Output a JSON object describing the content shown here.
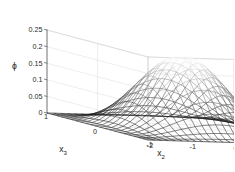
{
  "figure": {
    "background_color": "#ffffff",
    "box_color": "#d8d8d8",
    "grid_color": "#e2e2e2",
    "axis_color": "#6b6b6b",
    "text_color": "#2b2b2b"
  },
  "chart_data": {
    "type": "line",
    "render_style": "surface-mesh-3d",
    "title": "",
    "subtitle": "",
    "zlabel": "ϕ",
    "xlabel": "x_2",
    "ylabel": "x_3",
    "zlabel_display": "ϕ",
    "xlabel_base": "x",
    "xlabel_sub": "2",
    "ylabel_base": "x",
    "ylabel_sub": "3",
    "grid": true,
    "legend": "none",
    "colormap": "grayscale-bone",
    "zlim": [
      0,
      0.25
    ],
    "xlim": [
      -2,
      2
    ],
    "ylim": [
      -1,
      1
    ],
    "zticks": [
      0,
      0.05,
      0.1,
      0.15,
      0.2,
      0.25
    ],
    "ztick_labels": [
      "0",
      "0.05",
      "0.1",
      "0.15",
      "0.2",
      "0.25"
    ],
    "xticks": [
      -2,
      -1,
      0,
      1,
      2
    ],
    "xtick_labels": [
      "-2",
      "-1",
      "0",
      "1",
      "2"
    ],
    "yticks": [
      -1,
      0,
      1
    ],
    "ytick_labels": [
      "-1",
      "0",
      "1"
    ],
    "peak_value": 0.22,
    "peak_at": {
      "x2": 0,
      "x3": 0
    },
    "surface_description": "smooth unimodal bell-shaped density over x2 in [-2,2] and x3 in [-1,1], zero at the domain boundary",
    "mesh_nx": 26,
    "mesh_ny": 22,
    "surface_values_note": "phi(x2,x3) = 0.22 * cos(pi*x2/4)^2 * cos(pi*x3/2)^2",
    "samples": {
      "x2": [
        -2,
        -1.5,
        -1,
        -0.5,
        0,
        0.5,
        1,
        1.5,
        2
      ],
      "x3": [
        -1,
        -0.5,
        0,
        0.5,
        1
      ],
      "z": [
        [
          0,
          0,
          0,
          0,
          0,
          0,
          0,
          0,
          0
        ],
        [
          0,
          0.016,
          0.055,
          0.094,
          0.11,
          0.094,
          0.055,
          0.016,
          0
        ],
        [
          0,
          0.032,
          0.11,
          0.188,
          0.22,
          0.188,
          0.11,
          0.032,
          0
        ],
        [
          0,
          0.016,
          0.055,
          0.094,
          0.11,
          0.094,
          0.055,
          0.016,
          0
        ],
        [
          0,
          0,
          0,
          0,
          0,
          0,
          0,
          0,
          0
        ]
      ]
    }
  }
}
